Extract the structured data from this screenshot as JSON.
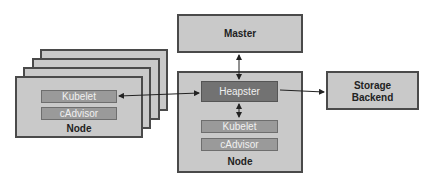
{
  "diagram": {
    "master": {
      "label": "Master"
    },
    "storage": {
      "label_line1": "Storage",
      "label_line2": "Backend"
    },
    "main_node": {
      "label": "Node",
      "heapster": "Heapster",
      "kubelet": "Kubelet",
      "cadvisor": "cAdvisor"
    },
    "other_nodes": {
      "label": "Node",
      "kubelet": "Kubelet",
      "cadvisor": "cAdvisor",
      "stack_count": 4
    },
    "connections": [
      {
        "from": "Heapster",
        "to": "Master",
        "type": "bidirectional"
      },
      {
        "from": "Heapster",
        "to": "Kubelet (other nodes)",
        "type": "bidirectional"
      },
      {
        "from": "Heapster",
        "to": "Kubelet (same node)",
        "type": "bidirectional"
      },
      {
        "from": "Heapster",
        "to": "Storage Backend",
        "type": "directed"
      }
    ]
  }
}
